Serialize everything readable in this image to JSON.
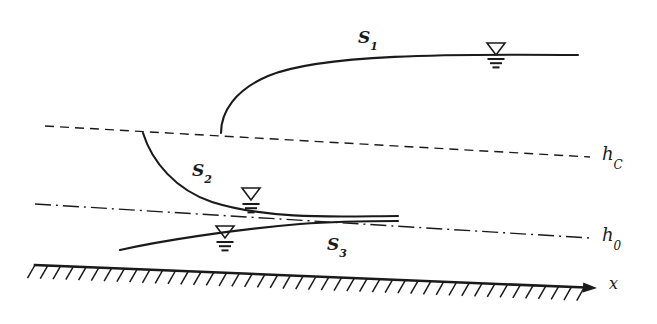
{
  "figure": {
    "kind": "hydraulic-water-surface-profile-diagram",
    "background_color": "#ffffff",
    "line_color": "#1a1a1a",
    "width": 657,
    "height": 324
  },
  "labels": {
    "profile_s1": {
      "base": "S",
      "sub": "1"
    },
    "profile_s2": {
      "base": "S",
      "sub": "2"
    },
    "profile_s3": {
      "base": "S",
      "sub": "3"
    },
    "critical_depth": {
      "base": "h",
      "sub": "C"
    },
    "normal_depth": {
      "base": "h",
      "sub": "0"
    },
    "axis_x": "x"
  },
  "reference_lines": [
    {
      "name": "critical-depth-line",
      "label_key": "critical_depth",
      "style": "dashed",
      "x1": 45,
      "y1": 126,
      "x2": 590,
      "y2": 157
    },
    {
      "name": "normal-depth-line",
      "label_key": "normal_depth",
      "style": "dash-dot",
      "x1": 35,
      "y1": 204,
      "x2": 590,
      "y2": 238
    }
  ],
  "channel_bed": {
    "name": "channel-bed-hatched",
    "x1": 35,
    "y1": 265,
    "x2": 597,
    "y2": 288,
    "hatch_count": 44,
    "hatch_length": 15,
    "arrow_label_key": "axis_x"
  },
  "profiles": [
    {
      "name": "s1-curve",
      "label_key": "profile_s1",
      "path": "M 221 133 C 221 112, 235 90, 268 76 C 320 54, 450 54, 578 55",
      "label_x": 358,
      "label_y": 27
    },
    {
      "name": "s2-curve",
      "label_key": "profile_s2",
      "path": "M 143 133 C 152 162, 176 190, 212 202 C 272 221, 350 216, 398 216",
      "label_x": 192,
      "label_y": 160
    },
    {
      "name": "s3-curve",
      "label_key": "profile_s3",
      "path": "M 120 250 C 160 241, 230 230, 300 224 C 340 221, 375 221, 398 221",
      "label_x": 327,
      "label_y": 234
    }
  ],
  "water_level_markers": [
    {
      "name": "water-level-marker-s1",
      "x": 496,
      "y": 55,
      "triangle_half_width": 9,
      "triangle_height": 12
    },
    {
      "name": "water-level-marker-s2",
      "x": 251,
      "y": 200,
      "triangle_half_width": 9,
      "triangle_height": 12
    },
    {
      "name": "water-level-marker-s3",
      "x": 225,
      "y": 238,
      "triangle_half_width": 9,
      "triangle_height": 12
    }
  ]
}
